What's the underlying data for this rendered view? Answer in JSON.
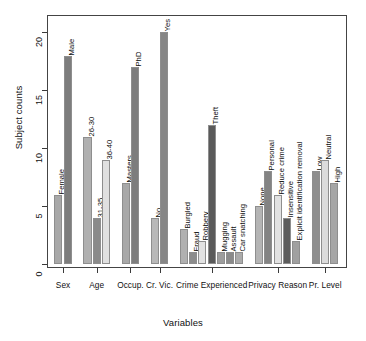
{
  "chart_data": {
    "type": "bar",
    "title": "",
    "xlabel": "Variables",
    "ylabel": "Subject counts",
    "ylim": [
      0,
      21.5
    ],
    "yticks": [
      0,
      5,
      10,
      15,
      20
    ],
    "ytick_labels": [
      "0",
      "5",
      "10",
      "15",
      "20"
    ],
    "grid": false,
    "legend": "none",
    "orientation": "vertical",
    "group_labels": [
      "Sex",
      "Age",
      "Occup.",
      "Cr. Vic.",
      "Crime Experienced",
      "Privacy Reason",
      "Pr. Level"
    ],
    "groups": [
      {
        "name": "Sex",
        "bars": [
          {
            "label": "Female",
            "value": 6,
            "color": "#a8a8a8"
          },
          {
            "label": "Male",
            "value": 18,
            "color": "#7d7d7d"
          }
        ]
      },
      {
        "name": "Age",
        "bars": [
          {
            "label": "26-30",
            "value": 11,
            "color": "#b0b0b0"
          },
          {
            "label": "31-35",
            "value": 4,
            "color": "#8a8a8a"
          },
          {
            "label": "36-40",
            "value": 9,
            "color": "#e0e0e0"
          }
        ]
      },
      {
        "name": "Occup.",
        "bars": [
          {
            "label": "Masters",
            "value": 7,
            "color": "#a8a8a8"
          },
          {
            "label": "PhD",
            "value": 17,
            "color": "#7d7d7d"
          }
        ]
      },
      {
        "name": "Cr. Vic.",
        "bars": [
          {
            "label": "No",
            "value": 4,
            "color": "#b8b8b8"
          },
          {
            "label": "Yes",
            "value": 20,
            "color": "#868686"
          }
        ]
      },
      {
        "name": "Crime Experienced",
        "bars": [
          {
            "label": "Burgled",
            "value": 3,
            "color": "#b0b0b0"
          },
          {
            "label": "Fraud",
            "value": 1,
            "color": "#8c8c8c"
          },
          {
            "label": "Robbery",
            "value": 2,
            "color": "#e2e2e2"
          },
          {
            "label": "Theft",
            "value": 12,
            "color": "#5a5a5a"
          },
          {
            "label": "Mugging",
            "value": 1,
            "color": "#9d9d9d"
          },
          {
            "label": "Assault",
            "value": 1,
            "color": "#8a8a8a"
          },
          {
            "label": "Car snatching",
            "value": 1,
            "color": "#ababab"
          }
        ]
      },
      {
        "name": "Privacy Reason",
        "bars": [
          {
            "label": "None",
            "value": 5,
            "color": "#b4b4b4"
          },
          {
            "label": "Personal",
            "value": 8,
            "color": "#838383"
          },
          {
            "label": "Reduce crime",
            "value": 6,
            "color": "#e2e2e2"
          },
          {
            "label": "Insensitive",
            "value": 4,
            "color": "#5c5c5c"
          },
          {
            "label": "Explicit identification removal",
            "value": 2,
            "color": "#a0a0a0"
          }
        ]
      },
      {
        "name": "Pr. Level",
        "bars": [
          {
            "label": "Low",
            "value": 8,
            "color": "#8e8e8e"
          },
          {
            "label": "Neutral",
            "value": 9,
            "color": "#dcdcdc"
          },
          {
            "label": "High",
            "value": 7,
            "color": "#a6a6a6"
          }
        ]
      }
    ]
  }
}
